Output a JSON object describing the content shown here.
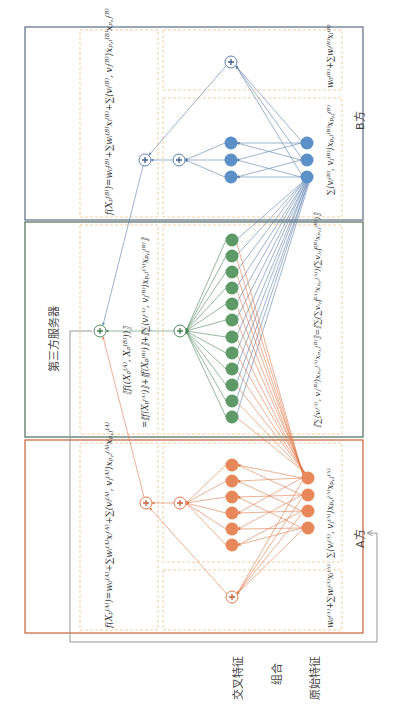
{
  "colors": {
    "party_b": "#5b7fae",
    "party_b_border": "#5a6b85",
    "server": "#4f8a5a",
    "server_border": "#4e6b55",
    "party_a": "#e07a4a",
    "party_a_border": "#c8603a",
    "dashed_box": "#f0c48a",
    "feedback_line": "#8a8a8a"
  },
  "row_labels": {
    "cross_features": "交叉特征",
    "combination": "组合",
    "raw_features": "原始特征"
  },
  "party_b": {
    "label": "B方",
    "formula_total": "f(X_p^(B)) = w_0^(B) + Σ_i w_i^(B) x_i^(B) + Σ_(i,j∈C) ⟨v_i^(B), v_j^(B)⟩ x_(p,i)^(B) x_(p,j)^(B)",
    "formula_cross": "Σ_(i,j∈C) ⟨v_i^(B), v_j^(B)⟩ x_(p,i)^(B) x_(p,j)^(B)",
    "formula_linear": "w_0^(B) + Σ_i w_i^(B) x_i^(B)",
    "cross_node_count": 3,
    "raw_node_count": 3
  },
  "server": {
    "label": "第三方服务器",
    "formula_total_line1": "[[f((X_p^(A), X_p^(B)))]]",
    "formula_total_line2": "= [[f(X_p^(A))]] + [[f(X_p^(B))]] + [[Σ_(i,j) ⟨v_i^(A), v_j^(B)⟩ x_(p,i)^(A) x_(p,j)^(B)]]",
    "formula_cross": "[[Σ_(i,j) ⟨v_i^(A), v_j^(B)⟩ x_(p,i)^(A) x_(p,j)^(B)]] = [[ Σ_(f=1)^k ( Σ_i v_(i,f)^(A) x_(p,i)^(A) )( Σ_j v_(j,f)^(B) x_(p,j)^(B) ) ]]",
    "cross_node_count": 12
  },
  "party_a": {
    "label": "A方",
    "formula_total": "f(X_p^(A)) = w_0^(A) + Σ_i w_i^(A) x_i^(A) + Σ_(i,j∈C) ⟨v_i^(A), v_j^(A)⟩ x_(p,i)^(A) x_(p,j)^(A)",
    "formula_cross": "Σ_(i,j∈C) ⟨v_i^(A), v_j^(A)⟩ x_(p,i)^(A) x_(p,j)^(A)",
    "formula_linear": "w_0^(A) + Σ_i w_i^(A) x_i^(A)",
    "cross_node_count": 6,
    "raw_node_count": 4
  },
  "display": {
    "b_total": "f(Xₚ⁽ᴮ⁾)=w₀⁽ᴮ⁾+∑wᵢ⁽ᴮ⁾xᵢ⁽ᴮ⁾+∑⟨vᵢ⁽ᴮ⁾, vⱼ⁽ᴮ⁾⟩xₚ,ᵢ⁽ᴮ⁾xₚ,ⱼ⁽ᴮ⁾",
    "b_cross": "∑⟨vᵢ⁽ᴮ⁾, vⱼ⁽ᴮ⁾⟩xₚ,ᵢ⁽ᴮ⁾xₚ,ⱼ⁽ᴮ⁾",
    "b_linear": "w₀⁽ᴮ⁾+∑wᵢ⁽ᴮ⁾xᵢ⁽ᴮ⁾",
    "s_total1": "⟦f((Xₚ⁽ᴬ⁾, Xₚ⁽ᴮ⁾))⟧",
    "s_total2": "=⟦f(Xₚ⁽ᴬ⁾)⟧+⟦f(Xₚ⁽ᴮ⁾)⟧+⟦∑⟨vᵢ⁽ᴬ⁾, vⱼ⁽ᴮ⁾⟩xₚ,ᵢ⁽ᴬ⁾xₚ,ⱼ⁽ᴮ⁾⟧",
    "s_cross": "⟦∑⟨vᵢ⁽ᴬ⁾, vⱼ⁽ᴮ⁾⟩xₚ,ᵢ⁽ᴬ⁾xₚ,ⱼ⁽ᴮ⁾⟧=⟦∑(∑vᵢ,f⁽ᴬ⁾xₚ,ᵢ⁽ᴬ⁾)(∑vⱼ,f⁽ᴮ⁾xₚ,ⱼ⁽ᴮ⁾)⟧",
    "a_total": "f(Xₚ⁽ᴬ⁾)=w₀⁽ᴬ⁾+∑wᵢ⁽ᴬ⁾xᵢ⁽ᴬ⁾+∑⟨vᵢ⁽ᴬ⁾, vⱼ⁽ᴬ⁾⟩xₚ,ᵢ⁽ᴬ⁾xₚ,ⱼ⁽ᴬ⁾",
    "a_cross": "∑⟨vᵢ⁽ᴬ⁾, vⱼ⁽ᴬ⁾⟩xₚ,ᵢ⁽ᴬ⁾xₚ,ⱼ⁽ᴬ⁾",
    "a_linear": "w₀⁽ᴬ⁾+∑wᵢ⁽ᴬ⁾xᵢ⁽ᴬ⁾"
  }
}
